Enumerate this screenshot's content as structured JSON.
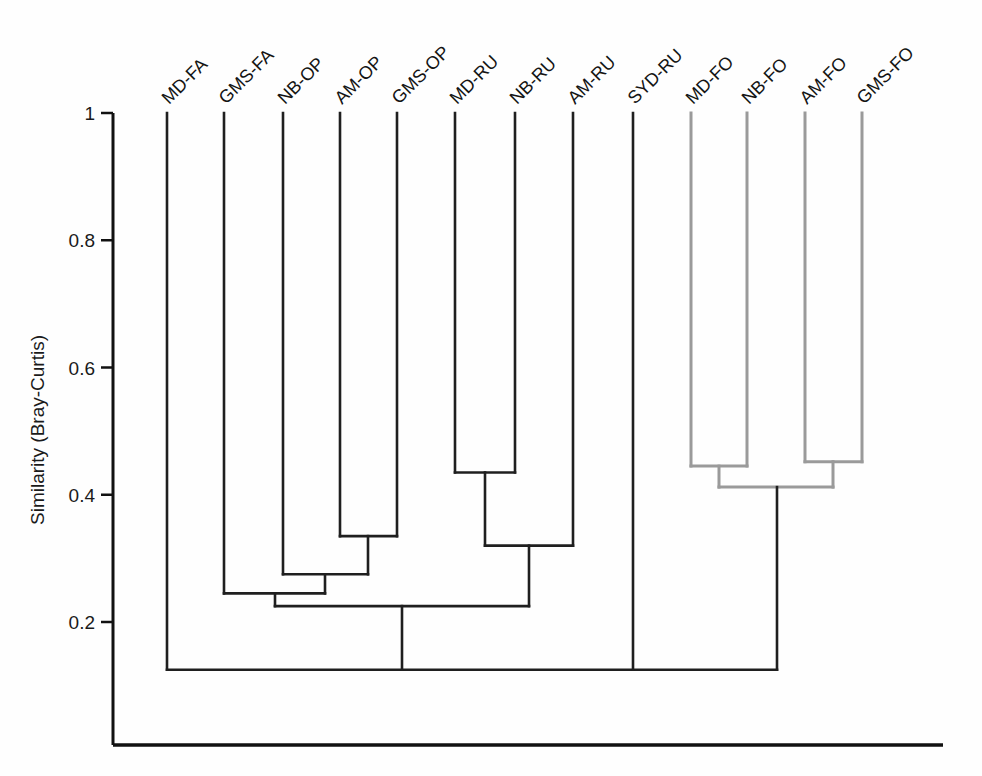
{
  "figure": {
    "background": "#fefefe",
    "width": 982,
    "height": 776
  },
  "chart_data": {
    "type": "line",
    "subtype": "dendrogram",
    "title": "",
    "xlabel": "",
    "ylabel": "Similarity (Bray-Curtis)",
    "ylim": [
      0,
      1
    ],
    "yticks": [
      1,
      0.8,
      0.6,
      0.4,
      0.2
    ],
    "ytick_labels": [
      "1",
      "0.8",
      "0.6",
      "0.4",
      "0.2"
    ],
    "grid": false,
    "legend": null,
    "orientation": "top-down",
    "leaf_label_rotation_deg": -45,
    "colors": {
      "primary": "#1f1f1f",
      "secondary": "#9a9a9a",
      "axis": "#111111"
    },
    "leaves": [
      {
        "name": "MD-FA",
        "x": 167,
        "color": "#1f1f1f"
      },
      {
        "name": "GMS-FA",
        "x": 224,
        "color": "#1f1f1f"
      },
      {
        "name": "NB-OP",
        "x": 283,
        "color": "#1f1f1f"
      },
      {
        "name": "AM-OP",
        "x": 340,
        "color": "#1f1f1f"
      },
      {
        "name": "GMS-OP",
        "x": 397,
        "color": "#1f1f1f"
      },
      {
        "name": "MD-RU",
        "x": 455,
        "color": "#1f1f1f"
      },
      {
        "name": "NB-RU",
        "x": 515,
        "color": "#1f1f1f"
      },
      {
        "name": "AM-RU",
        "x": 573,
        "color": "#1f1f1f"
      },
      {
        "name": "SYD-RU",
        "x": 633,
        "color": "#1f1f1f"
      },
      {
        "name": "MD-FO",
        "x": 691,
        "color": "#9a9a9a"
      },
      {
        "name": "NB-FO",
        "x": 747,
        "color": "#9a9a9a"
      },
      {
        "name": "AM-FO",
        "x": 805,
        "color": "#9a9a9a"
      },
      {
        "name": "GMS-FO",
        "x": 862,
        "color": "#9a9a9a"
      }
    ],
    "merges": [
      {
        "id": "m-op-am-gms",
        "members": [
          "AM-OP",
          "GMS-OP"
        ],
        "similarity": 0.335,
        "x_left": 340,
        "x_right": 397,
        "center": 368,
        "color": "#1f1f1f"
      },
      {
        "id": "m-op-all",
        "members": [
          "NB-OP",
          "AM-OP",
          "GMS-OP"
        ],
        "similarity": 0.275,
        "x_left": 283,
        "x_right": 368,
        "center": 325,
        "color": "#1f1f1f"
      },
      {
        "id": "m-fa-op",
        "members": [
          "GMS-FA",
          "NB-OP",
          "AM-OP",
          "GMS-OP"
        ],
        "similarity": 0.245,
        "x_left": 224,
        "x_right": 325,
        "center": 275,
        "color": "#1f1f1f"
      },
      {
        "id": "m-ru-md-nb",
        "members": [
          "MD-RU",
          "NB-RU"
        ],
        "similarity": 0.435,
        "x_left": 455,
        "x_right": 515,
        "center": 485,
        "color": "#1f1f1f"
      },
      {
        "id": "m-ru-all",
        "members": [
          "MD-RU",
          "NB-RU",
          "AM-RU"
        ],
        "similarity": 0.32,
        "x_left": 485,
        "x_right": 573,
        "center": 529,
        "color": "#1f1f1f"
      },
      {
        "id": "m-faop-ru",
        "members": [
          "GMS-FA",
          "NB-OP",
          "AM-OP",
          "GMS-OP",
          "MD-RU",
          "NB-RU",
          "AM-RU"
        ],
        "similarity": 0.225,
        "x_left": 275,
        "x_right": 529,
        "center": 402,
        "color": "#1f1f1f"
      },
      {
        "id": "m-fo-md-nb",
        "members": [
          "MD-FO",
          "NB-FO"
        ],
        "similarity": 0.445,
        "x_left": 691,
        "x_right": 747,
        "center": 719,
        "color": "#9a9a9a"
      },
      {
        "id": "m-fo-am-gms",
        "members": [
          "AM-FO",
          "GMS-FO"
        ],
        "similarity": 0.452,
        "x_left": 805,
        "x_right": 862,
        "center": 833,
        "color": "#9a9a9a"
      },
      {
        "id": "m-fo-all",
        "members": [
          "MD-FO",
          "NB-FO",
          "AM-FO",
          "GMS-FO"
        ],
        "similarity": 0.412,
        "x_left": 719,
        "x_right": 833,
        "center": 777,
        "color": "#9a9a9a"
      },
      {
        "id": "m-root",
        "members": [
          "MD-FA",
          "FA-OP-RU-group",
          "SYD-RU",
          "FO-group"
        ],
        "similarity": 0.125,
        "x_left": 167,
        "x_right": 777,
        "center": 470,
        "color": "#1f1f1f"
      }
    ],
    "notes": {
      "gray_cluster": "FO sites (MD-FO, NB-FO, AM-FO, GMS-FO) drawn in gray",
      "root_children_x": [
        167,
        402,
        633,
        777
      ]
    }
  },
  "axis": {
    "y_title": "Similarity (Bray-Curtis)",
    "baseline_label": ""
  }
}
